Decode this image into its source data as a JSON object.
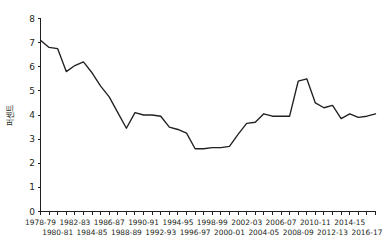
{
  "chart_data": {
    "type": "line",
    "title": "",
    "xlabel": "",
    "ylabel": "퍼센트",
    "ylim": [
      0,
      8
    ],
    "y_ticks": [
      0,
      1,
      2,
      3,
      4,
      5,
      6,
      7,
      8
    ],
    "grid": false,
    "legend": "none",
    "line_color": "#231f20",
    "axis_color": "#231f20",
    "categories": [
      "1978-79",
      "1979-80",
      "1980-81",
      "1981-82",
      "1982-83",
      "1983-84",
      "1984-85",
      "1985-86",
      "1986-87",
      "1987-88",
      "1988-89",
      "1989-90",
      "1990-91",
      "1991-92",
      "1992-93",
      "1993-94",
      "1994-95",
      "1995-96",
      "1996-97",
      "1997-98",
      "1998-99",
      "1999-00",
      "2000-01",
      "2001-02",
      "2002-03",
      "2003-04",
      "2004-05",
      "2005-06",
      "2006-07",
      "2007-08",
      "2008-09",
      "2009-10",
      "2010-11",
      "2011-12",
      "2012-13",
      "2013-14",
      "2014-15",
      "2015-16",
      "2016-17",
      "2017-18"
    ],
    "values": [
      7.1,
      6.8,
      6.75,
      5.8,
      6.05,
      6.2,
      5.75,
      5.2,
      4.75,
      4.1,
      3.45,
      4.1,
      4.0,
      4.0,
      3.95,
      3.5,
      3.4,
      3.25,
      2.6,
      2.6,
      2.65,
      2.65,
      2.7,
      3.2,
      3.65,
      3.7,
      4.05,
      3.95,
      3.95,
      3.95,
      5.4,
      5.5,
      4.5,
      4.3,
      4.4,
      3.85,
      4.05,
      3.9,
      3.95,
      4.05
    ],
    "x_tick_labels_visible": [
      "1978-79",
      "1980-81",
      "1982-83",
      "1984-85",
      "1986-87",
      "1988-89",
      "1990-91",
      "1992-93",
      "1994-95",
      "1996-97",
      "1998-99",
      "2000-01",
      "2002-03",
      "2004-05",
      "2006-07",
      "2008-09",
      "2010-11",
      "2012-13",
      "2014-15",
      "2016-17"
    ]
  }
}
